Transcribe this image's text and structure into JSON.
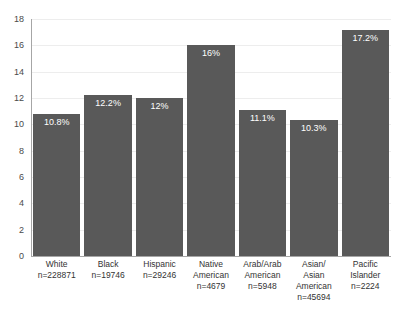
{
  "chart_data": {
    "type": "bar",
    "title": "",
    "subtitle": "",
    "xlabel": "",
    "ylabel": "",
    "ylim": [
      0,
      18
    ],
    "ytick_step": 2,
    "yticks": [
      18,
      16,
      14,
      12,
      10,
      8,
      6,
      4,
      2,
      0
    ],
    "grid": true,
    "legend": false,
    "bar_color": "#595959",
    "gridline_color": "#ededed",
    "axis_color": "#a6a6a6",
    "data_label_color": "#ffffff",
    "categories": [
      "White",
      "Black",
      "Hispanic",
      "Native American",
      "Arab/Arab American",
      "Asian/ Asian American",
      "Pacific Islander"
    ],
    "values": [
      10.8,
      12.2,
      12,
      16,
      11.1,
      10.3,
      17.2
    ],
    "data_labels": [
      "10.8%",
      "12.2%",
      "12%",
      "16%",
      "11.1%",
      "10.3%",
      "17.2%"
    ],
    "counts": [
      "n=228871",
      "n=19746",
      "n=29246",
      "n=4679",
      "n=5948",
      "n=45694",
      "n=2224"
    ],
    "bars": [
      {
        "name_lines": [
          "White"
        ],
        "count": "n=228871",
        "value": 10.8,
        "label": "10.8%"
      },
      {
        "name_lines": [
          "Black"
        ],
        "count": "n=19746",
        "value": 12.2,
        "label": "12.2%"
      },
      {
        "name_lines": [
          "Hispanic"
        ],
        "count": "n=29246",
        "value": 12,
        "label": "12%"
      },
      {
        "name_lines": [
          "Native",
          "American"
        ],
        "count": "n=4679",
        "value": 16,
        "label": "16%"
      },
      {
        "name_lines": [
          "Arab/Arab",
          "American"
        ],
        "count": "n=5948",
        "value": 11.1,
        "label": "11.1%"
      },
      {
        "name_lines": [
          "Asian/",
          "Asian",
          "American"
        ],
        "count": "n=45694",
        "value": 10.3,
        "label": "10.3%"
      },
      {
        "name_lines": [
          "Pacific",
          "Islander"
        ],
        "count": "n=2224",
        "value": 17.2,
        "label": "17.2%"
      }
    ]
  }
}
